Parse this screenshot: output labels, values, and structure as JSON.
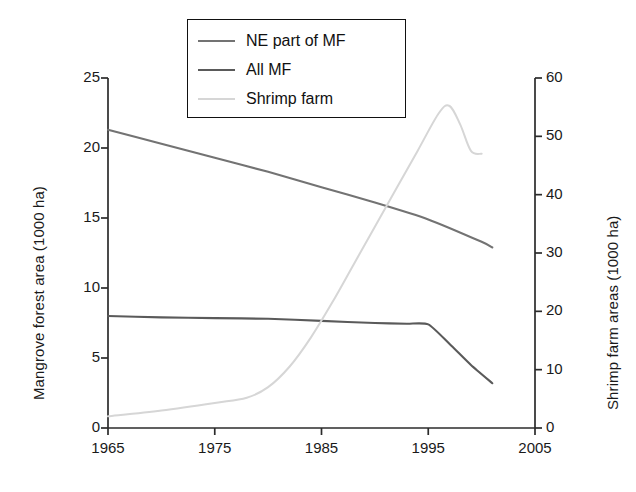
{
  "chart_data": {
    "type": "line",
    "title": "",
    "xlabel": "",
    "ylabel": "Mangrove forest area (1000 ha)",
    "y2label": "Shrimp farm areas (1000 ha)",
    "xlim": [
      1965,
      2005
    ],
    "ylim": [
      0,
      25
    ],
    "y2lim": [
      0,
      60
    ],
    "grid": false,
    "legend_position": "top-center",
    "xticks": [
      1965,
      1975,
      1985,
      1995,
      2005
    ],
    "xtick_labels": [
      "1965",
      "1975",
      "1985",
      "1995",
      "2005"
    ],
    "yticks": [
      0,
      5,
      10,
      15,
      20,
      25
    ],
    "ytick_labels": [
      "0",
      "5",
      "10",
      "15",
      "20",
      "25"
    ],
    "y2ticks": [
      0,
      10,
      20,
      30,
      40,
      50,
      60
    ],
    "y2tick_labels": [
      "0",
      "10",
      "20",
      "30",
      "40",
      "50",
      "60"
    ],
    "series": [
      {
        "name": "NE part of MF",
        "axis": "left",
        "color": "#737373",
        "x": [
          1965,
          1970,
          1975,
          1980,
          1985,
          1990,
          1995,
          2000,
          2001
        ],
        "values": [
          21.3,
          20.3,
          19.3,
          18.3,
          17.2,
          16.1,
          14.9,
          13.3,
          12.9
        ]
      },
      {
        "name": "All MF",
        "axis": "left",
        "color": "#5a5a5a",
        "x": [
          1965,
          1970,
          1975,
          1980,
          1985,
          1990,
          1993,
          1995,
          1997,
          1999,
          2001
        ],
        "values": [
          8.0,
          7.9,
          7.85,
          7.8,
          7.65,
          7.5,
          7.45,
          7.4,
          6.0,
          4.5,
          3.2
        ]
      },
      {
        "name": "Shrimp farm",
        "axis": "right",
        "color": "#d6d6d6",
        "x": [
          1965,
          1970,
          1975,
          1978,
          1980,
          1982,
          1984,
          1986,
          1988,
          1990,
          1992,
          1994,
          1996,
          1997,
          1998,
          1999,
          2000
        ],
        "values": [
          2.0,
          3.0,
          4.3,
          5.2,
          7.0,
          10.5,
          15.5,
          21.5,
          28.0,
          34.5,
          41.0,
          47.5,
          54.0,
          55.2,
          52.0,
          47.5,
          47.0
        ]
      }
    ]
  },
  "legend": {
    "entries": [
      {
        "label": "NE part of MF",
        "color": "#737373"
      },
      {
        "label": "All MF",
        "color": "#5a5a5a"
      },
      {
        "label": "Shrimp farm",
        "color": "#d6d6d6"
      }
    ]
  },
  "axes": {
    "left_title": "Mangrove forest area (1000 ha)",
    "right_title": "Shrimp farm areas (1000 ha)"
  }
}
